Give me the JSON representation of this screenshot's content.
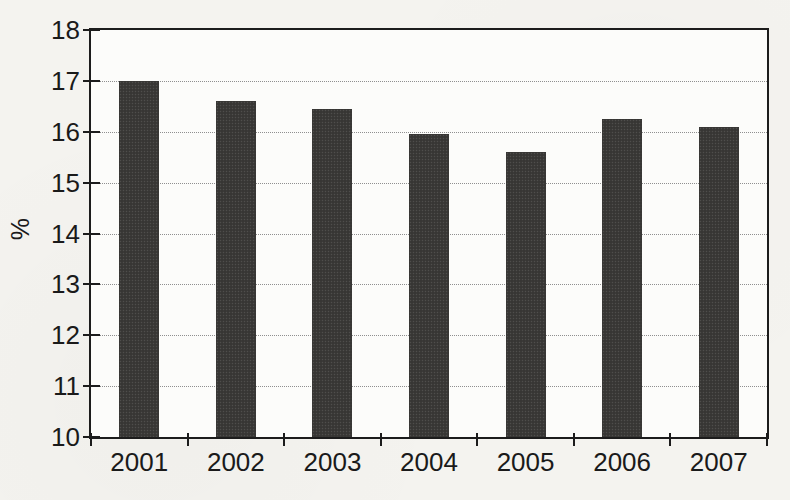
{
  "chart_data": {
    "type": "bar",
    "title": "",
    "categories": [
      "2001",
      "2002",
      "2003",
      "2004",
      "2005",
      "2006",
      "2007"
    ],
    "values": [
      17.0,
      16.6,
      16.45,
      15.95,
      15.6,
      16.25,
      16.1
    ],
    "xlabel": "",
    "ylabel": "%",
    "ylim": [
      10,
      18
    ],
    "ytick_interval": 1,
    "ytick_labels": [
      "18",
      "17",
      "16",
      "15",
      "14",
      "13",
      "12",
      "11",
      "10"
    ],
    "grid": "horizontal-dotted",
    "legend_position": "none",
    "bar_color": "#3b3a38",
    "gridline_color": "#8f8f8f",
    "frame_color": "#1c1c1c",
    "text_color": "#1a1a1a",
    "background_color": "#f4f3ef",
    "plot_background_color": "#fcfcfa"
  }
}
